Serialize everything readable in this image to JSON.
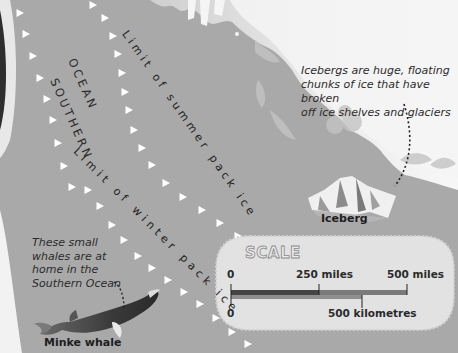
{
  "map": {
    "ocean_name_line1": "SOUTHERN",
    "ocean_name_line2": "OCEAN",
    "summer_limit_label": "Limit of summer pack ice",
    "winter_limit_label": "Limit of winter pack ice"
  },
  "annotations": {
    "iceberg_caption_lines": [
      "Icebergs are huge, floating",
      "chunks of ice that have broken",
      "off ice shelves and glaciers"
    ],
    "iceberg_label": "Iceberg",
    "whale_caption_lines": [
      "These small",
      "whales are at",
      "home in the",
      "Southern Ocean"
    ],
    "whale_label": "Minke whale"
  },
  "scale": {
    "title": "SCALE",
    "miles_ticks": [
      "0",
      "250 miles",
      "500 miles"
    ],
    "km_ticks": [
      "0",
      "500 kilometres"
    ]
  },
  "colors": {
    "ocean": "#a9a9a9",
    "land": "#dcdcdc",
    "scale_panel": "#e2e2e2",
    "miles_bar_dark": "#444444",
    "miles_bar_light": "#7a7a7a",
    "km_bar": "#8f8f8f"
  }
}
